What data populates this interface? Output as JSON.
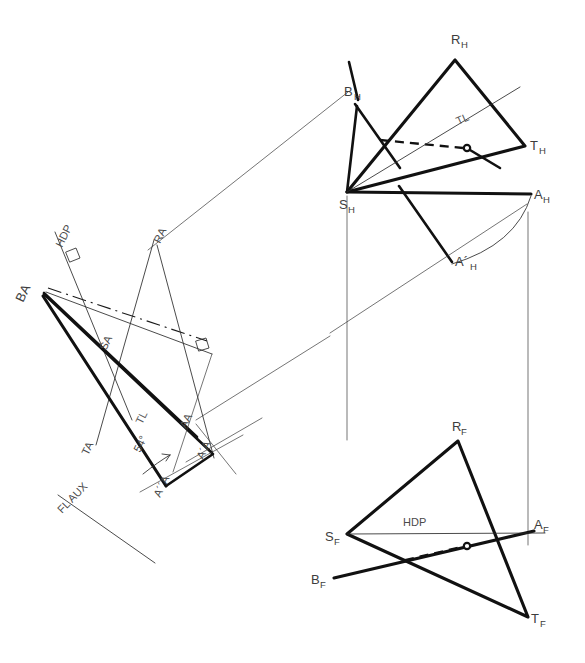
{
  "drawing": {
    "title": "Descriptive geometry: line-plane piercing point and true angle construction",
    "ink_color": "#111111",
    "label_color": "#3d3d3d",
    "background": "#ffffff"
  },
  "views": {
    "top": {
      "name": "top-view",
      "labels": [
        {
          "id": "RH",
          "base": "R",
          "sub": "H",
          "x": 451,
          "y": 44
        },
        {
          "id": "BH",
          "base": "B",
          "sub": "H",
          "x": 344,
          "y": 96
        },
        {
          "id": "TH",
          "base": "T",
          "sub": "H",
          "x": 530,
          "y": 150
        },
        {
          "id": "SH",
          "base": "S",
          "sub": "H",
          "x": 341,
          "y": 208
        },
        {
          "id": "AH",
          "base": "A",
          "sub": "H",
          "x": 534,
          "y": 199
        },
        {
          "id": "A'H",
          "base": "A´",
          "sub": "H",
          "x": 459,
          "y": 267
        }
      ],
      "annotations": [
        {
          "id": "TL",
          "text": "TL",
          "x": 466,
          "y": 121
        }
      ],
      "points": {
        "RH": [
          455,
          60
        ],
        "TH": [
          525,
          146
        ],
        "SH": [
          347,
          192
        ],
        "AH": [
          531,
          194
        ],
        "BH": [
          355,
          104
        ],
        "A_prime_H": [
          452,
          262
        ],
        "pierce": [
          466,
          148
        ]
      }
    },
    "front": {
      "name": "front-view",
      "labels": [
        {
          "id": "RF",
          "base": "R",
          "sub": "F",
          "x": 452,
          "y": 431
        },
        {
          "id": "SF",
          "base": "S",
          "sub": "F",
          "x": 327,
          "y": 540
        },
        {
          "id": "AF",
          "base": "A",
          "sub": "F",
          "x": 534,
          "y": 529
        },
        {
          "id": "BF",
          "base": "B",
          "sub": "F",
          "x": 313,
          "y": 582
        },
        {
          "id": "TF",
          "base": "T",
          "sub": "F",
          "x": 531,
          "y": 623
        }
      ],
      "annotations": [
        {
          "id": "HDP",
          "text": "HDP",
          "x": 418,
          "y": 527
        }
      ],
      "points": {
        "RF": [
          458,
          441
        ],
        "SF": [
          347,
          534
        ],
        "AF": [
          528,
          531
        ],
        "TF": [
          528,
          617
        ],
        "BF": [
          334,
          578
        ],
        "pierce": [
          466,
          546
        ]
      }
    },
    "auxiliary": {
      "name": "auxiliary-view",
      "labels": [
        {
          "id": "BA",
          "text": "BA",
          "x": 23,
          "y": 299
        },
        {
          "id": "HDP",
          "text": "HDP",
          "x": 62,
          "y": 244
        },
        {
          "id": "RA",
          "text": "RA",
          "x": 163,
          "y": 240
        },
        {
          "id": "SA",
          "text": "SA",
          "x": 108,
          "y": 347
        },
        {
          "id": "TA",
          "text": "TA",
          "x": 90,
          "y": 452
        },
        {
          "id": "TL",
          "text": "TL",
          "x": 144,
          "y": 421
        },
        {
          "id": "AA",
          "text": "AA",
          "x": 188,
          "y": 425
        },
        {
          "id": "A'A",
          "text": "A´A",
          "x": 202,
          "y": 456
        },
        {
          "id": "A''A",
          "text": "A´´A",
          "x": 162,
          "y": 494
        },
        {
          "id": "FLAUX",
          "text": "FL AUX",
          "x": 62,
          "y": 512
        }
      ],
      "angle": {
        "value": "54°",
        "x": 148,
        "y": 449
      },
      "points": {
        "BA": [
          42,
          295
        ],
        "SA": [
          115,
          355
        ],
        "AA": [
          196,
          436
        ],
        "A_prime_A": [
          212,
          453
        ],
        "A_double_prime_A": [
          166,
          486
        ]
      }
    }
  },
  "legend": {
    "tl_meaning": "TL",
    "hdp_meaning": "HDP",
    "fl_meaning": "FL AUX",
    "angle_label": "54°"
  }
}
